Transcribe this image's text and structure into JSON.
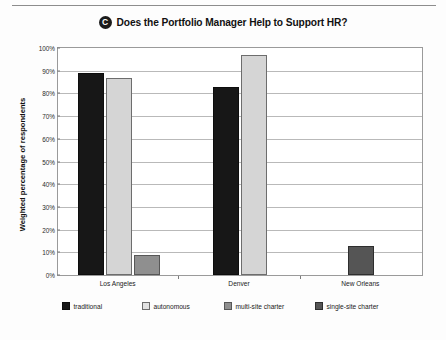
{
  "header": {
    "badge_letter": "C",
    "title": "Does the Portfolio Manager Help to Support HR?"
  },
  "chart_data": {
    "type": "bar",
    "title": "Does the Portfolio Manager Help to Support HR?",
    "xlabel": "",
    "ylabel": "Weighted percentage of respondents",
    "ylim": [
      0,
      100
    ],
    "ytick_labels": [
      "0%",
      "10%",
      "20%",
      "30%",
      "40%",
      "50%",
      "60%",
      "70%",
      "80%",
      "90%",
      "100%"
    ],
    "ytick_values": [
      0,
      10,
      20,
      30,
      40,
      50,
      60,
      70,
      80,
      90,
      100
    ],
    "grid": true,
    "legend_position": "bottom",
    "categories": [
      "Los Angeles",
      "Denver",
      "New Orleans"
    ],
    "series": [
      {
        "name": "traditional",
        "color": "#171717",
        "values": [
          89,
          83,
          null
        ]
      },
      {
        "name": "autonomous",
        "color": "#d5d5d5",
        "values": [
          87,
          97,
          null
        ]
      },
      {
        "name": "multi-site charter",
        "color": "#8f8f8f",
        "values": [
          9,
          null,
          null
        ]
      },
      {
        "name": "single-site charter",
        "color": "#555555",
        "values": [
          null,
          null,
          13
        ]
      }
    ]
  },
  "legend": {
    "items": [
      {
        "label": "traditional"
      },
      {
        "label": "autonomous"
      },
      {
        "label": "multi-site charter"
      },
      {
        "label": "single-site charter"
      }
    ]
  }
}
